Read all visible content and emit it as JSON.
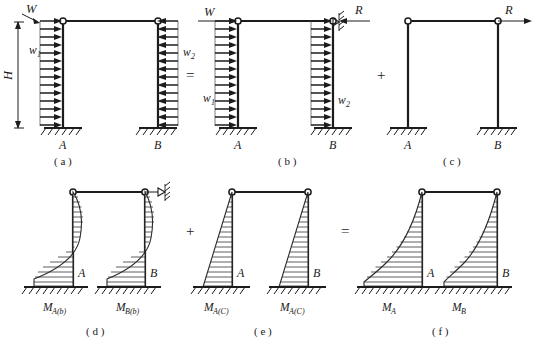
{
  "figure": {
    "operators": {
      "equals_top": "=",
      "plus_top": "+",
      "plus_bottom": "+",
      "equals_bottom": "="
    }
  },
  "panels": [
    {
      "id": "a",
      "caption": "( a )",
      "labels": {
        "applied_load": "W",
        "height": "H",
        "left_distributed": "w",
        "left_distributed_sub": "1",
        "right_distributed": "w",
        "right_distributed_sub": "2",
        "support_left": "A",
        "support_right": "B"
      }
    },
    {
      "id": "b",
      "caption": "( b )",
      "labels": {
        "applied_load": "W",
        "reaction": "R",
        "left_distributed": "w",
        "left_distributed_sub": "1",
        "right_distributed": "w",
        "right_distributed_sub": "2",
        "support_left": "A",
        "support_right": "B"
      }
    },
    {
      "id": "c",
      "caption": "( c )",
      "labels": {
        "reaction": "R",
        "support_left": "A",
        "support_right": "B"
      }
    },
    {
      "id": "d",
      "caption": "( d )",
      "labels": {
        "node_left": "A",
        "node_right": "B",
        "moment_left": "M",
        "moment_left_sub": "A(b)",
        "moment_right": "M",
        "moment_right_sub": "B(b)"
      }
    },
    {
      "id": "e",
      "caption": "( e )",
      "labels": {
        "node_left": "A",
        "node_right": "B",
        "moment_left": "M",
        "moment_left_sub": "A(C)",
        "moment_right": "M",
        "moment_right_sub": "A(C)"
      }
    },
    {
      "id": "f",
      "caption": "( f )",
      "labels": {
        "node_left": "A",
        "node_right": "B",
        "moment_left": "M",
        "moment_left_sub": "A",
        "moment_right": "M",
        "moment_right_sub": "B"
      }
    }
  ],
  "colors": {
    "stroke": "#1c1c1c",
    "hatch": "#2a2a2a",
    "background": "#ffffff"
  }
}
